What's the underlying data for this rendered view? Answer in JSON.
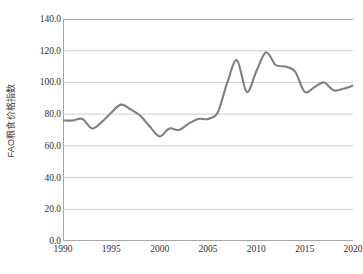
{
  "chart_data": {
    "type": "line",
    "title": "",
    "xlabel": "",
    "ylabel": "FAO粮食价格指数",
    "xlim": [
      1990,
      2020
    ],
    "ylim": [
      0.0,
      140.0
    ],
    "grid": true,
    "legend": "none",
    "y_ticks": [
      "0.0",
      "20.0",
      "40.0",
      "60.0",
      "80.0",
      "100.0",
      "120.0",
      "140.0"
    ],
    "y_tick_values": [
      0.0,
      20.0,
      40.0,
      60.0,
      80.0,
      100.0,
      120.0,
      140.0
    ],
    "x_ticks": [
      "1990",
      "1995",
      "2000",
      "2005",
      "2010",
      "2015",
      "2020"
    ],
    "x_tick_values": [
      1990,
      1995,
      2000,
      2005,
      2010,
      2015,
      2020
    ],
    "x": [
      1990,
      1991,
      1992,
      1993,
      1994,
      1995,
      1996,
      1997,
      1998,
      1999,
      2000,
      2001,
      2002,
      2003,
      2004,
      2005,
      2006,
      2007,
      2008,
      2009,
      2010,
      2011,
      2012,
      2013,
      2014,
      2015,
      2016,
      2017,
      2018,
      2019,
      2020
    ],
    "series": [
      {
        "name": "FAO粮食价格指数",
        "color": "#808080",
        "values": [
          76,
          76,
          77,
          71,
          75,
          81,
          86,
          83,
          79,
          72,
          66,
          71,
          70,
          74,
          77,
          77,
          81,
          100,
          114,
          94,
          107,
          119,
          111,
          110,
          107,
          94,
          97,
          100,
          95,
          96,
          98
        ]
      }
    ]
  },
  "style": {
    "line_color": "#7d7d7d",
    "grid_color": "#c8c8c8",
    "axis_color": "#a6a6a6",
    "text_color": "#2f2f2f",
    "background": "#ffffff"
  }
}
